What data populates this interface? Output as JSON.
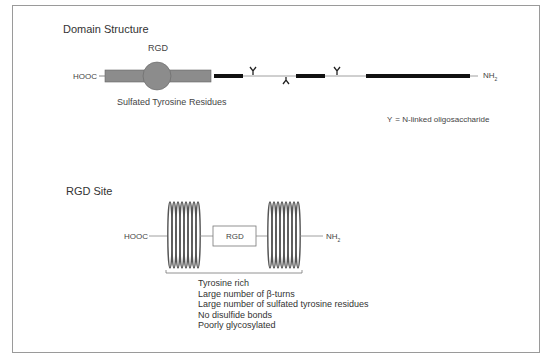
{
  "domain_structure": {
    "title": "Domain Structure",
    "rgd_label": "RGD",
    "n_term_left": "HOOC",
    "c_term_right": "NH",
    "c_term_sub": "2",
    "sulfated_label": "Sulfated Tyrosine Residues",
    "legend": {
      "symbol": "Y",
      "text": "=  N-linked oligosaccharide"
    }
  },
  "rgd_site": {
    "title": "RGD Site",
    "left_term": "HOOC",
    "right_term": "NH",
    "right_sub": "2",
    "box_label": "RGD",
    "properties": [
      "Tyrosine rich",
      "Large number of β-turns",
      "Large number of sulfated tyrosine residues",
      "No disulfide bonds",
      "Poorly glycosylated"
    ]
  },
  "colors": {
    "gray_domain": "#8c8c8c",
    "black_domain": "#111111",
    "line": "#888888",
    "frame": "#9a9a9a"
  }
}
